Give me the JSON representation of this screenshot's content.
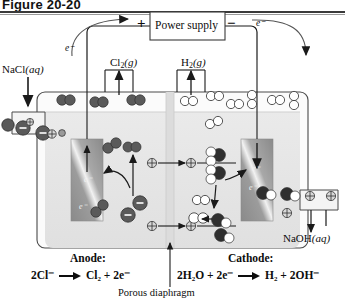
{
  "figure": {
    "label": "Figure 20-20"
  },
  "circuit": {
    "power_supply_label": "Power supply",
    "positive_terminal": "+",
    "negative_terminal": "−",
    "electron_label_left": "e⁻",
    "electron_label_right": "e⁻"
  },
  "inlets": {
    "feed_label": "NaCl(aq)",
    "feed_label_main": "NaCl",
    "feed_label_state": "(aq)",
    "product_label": "NaOH(aq)",
    "product_label_main": "NaOH",
    "product_label_state": "(aq)"
  },
  "gases": {
    "left": {
      "formula": "Cl",
      "subscript": "2",
      "state": "(g)"
    },
    "right": {
      "formula": "H",
      "subscript": "2",
      "state": "(g)"
    }
  },
  "electrodes": {
    "anode_electron_marks": [
      "e⁻",
      "e⁻"
    ],
    "cathode_electron_marks": [
      "e⁻",
      "e⁻"
    ]
  },
  "half_reactions": {
    "anode_heading": "Anode:",
    "cathode_heading": "Cathode:",
    "anode_equation": {
      "left_side": "2Cl⁻",
      "right_side": "Cl₂ + 2e⁻",
      "parts_left": [
        {
          "t": "2Cl",
          "s": "⁻"
        }
      ],
      "parts_right": [
        {
          "t": "Cl",
          "sub": "2"
        },
        {
          "t": " + 2e",
          "s": "⁻"
        }
      ]
    },
    "cathode_equation": {
      "left_side": "2H₂O + 2e⁻",
      "right_side": "H₂ + 2OH⁻",
      "parts_left": [
        {
          "t": "2H",
          "sub": "2"
        },
        {
          "t": "O + 2e",
          "s": "⁻"
        }
      ],
      "parts_right": [
        {
          "t": "H",
          "sub": "2"
        },
        {
          "t": " + 2OH",
          "s": "⁻"
        }
      ]
    }
  },
  "separator": {
    "label": "Porous diaphragm"
  },
  "species_legend": {
    "chloride_ion": "Cl⁻",
    "sodium_ion": "Na⁺",
    "chlorine_molecule": "Cl₂",
    "hydrogen_molecule": "H₂",
    "water_molecule": "H₂O",
    "hydroxide_ion": "OH⁻"
  },
  "colors": {
    "ink": "#0d0d0d",
    "wire": "#2b2b2b",
    "cell_wall": "#4a4a4a",
    "solution_fill": "#e6e6e6",
    "headspace_fill": "#f7f7f7",
    "diaphragm_fill": "#dcdcdc",
    "electrode_dark": "#8f8f8f",
    "electrode_light": "#f0f0f0",
    "dark_ion": "#5a5a5a",
    "light_ion": "#ffffff",
    "rule": "#3a3a3a"
  }
}
